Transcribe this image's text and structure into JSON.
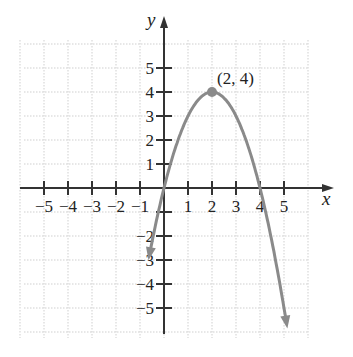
{
  "chart_data": {
    "type": "line",
    "title": "",
    "xlabel": "x",
    "ylabel": "y",
    "xlim": [
      -6,
      6
    ],
    "ylim": [
      -6,
      6
    ],
    "grid": true,
    "x_ticks": [
      -5,
      -4,
      -3,
      -2,
      -1,
      1,
      2,
      3,
      4,
      5
    ],
    "y_ticks": [
      -5,
      -4,
      -3,
      -2,
      2,
      3,
      4,
      5,
      1
    ],
    "x_tick_labels": [
      "−5",
      "−4",
      "−3",
      "−2",
      "−1",
      "1",
      "2",
      "3",
      "4",
      "5"
    ],
    "y_tick_labels": [
      "5",
      "4",
      "3",
      "2",
      "1",
      "−2",
      "−3",
      "−4",
      "−5"
    ],
    "series": [
      {
        "name": "f(x) = -(x-2)^2 + 4",
        "equation": "y = -(x - 2)^2 + 4",
        "x": [
          -0.6,
          0,
          1,
          2,
          3,
          4,
          5.2
        ],
        "y": [
          -2.3,
          0,
          3,
          4,
          3,
          0,
          -6.2
        ],
        "arrows_both_ends": true,
        "color": "#8a8a8a"
      }
    ],
    "annotations": [
      {
        "text": "(2, 4)",
        "x": 2,
        "y": 4,
        "marker": "point"
      }
    ]
  },
  "labels": {
    "x_axis": "x",
    "y_axis": "y",
    "vertex": "(2, 4)"
  },
  "colors": {
    "curve": "#8a8a8a",
    "axis": "#333333",
    "grid": "#cfcfcf"
  }
}
